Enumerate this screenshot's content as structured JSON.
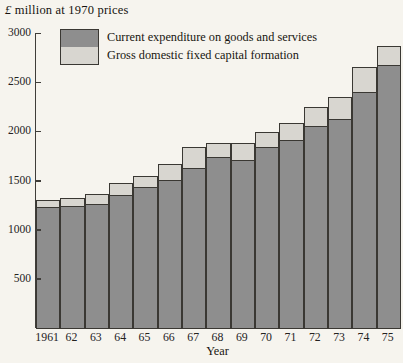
{
  "figure": {
    "title": "£ million at 1970 prices"
  },
  "colors": {
    "background": "#f6f4ee",
    "axis": "#3f3d39",
    "bar_outline": "#3a3833",
    "current_expenditure": "#8e8e8e",
    "capital_formation": "#d8d6d0",
    "text": "#1e1c1a"
  },
  "chart_data": {
    "type": "bar",
    "stacked": true,
    "title": "£ million at 1970 prices",
    "xlabel": "Year",
    "ylabel": "",
    "ylim": [
      0,
      3000
    ],
    "yticks": [
      500,
      1000,
      1500,
      2000,
      2500,
      3000
    ],
    "grid": false,
    "legend_position": "top-left",
    "categories": [
      "1961",
      "62",
      "63",
      "64",
      "65",
      "66",
      "67",
      "68",
      "69",
      "70",
      "71",
      "72",
      "73",
      "74",
      "75"
    ],
    "series": [
      {
        "name": "Current expenditure on goods and services",
        "color": "#8e8e8e",
        "values": [
          1240,
          1250,
          1270,
          1365,
          1445,
          1515,
          1640,
          1750,
          1715,
          1855,
          1920,
          2065,
          2135,
          2410,
          2680
        ]
      },
      {
        "name": "Gross domestic fixed capital formation",
        "color": "#d8d6d0",
        "values": [
          85,
          90,
          115,
          130,
          125,
          175,
          220,
          155,
          185,
          160,
          190,
          200,
          235,
          265,
          210
        ]
      }
    ],
    "totals": [
      1325,
      1340,
      1385,
      1495,
      1570,
      1690,
      1860,
      1905,
      1900,
      2015,
      2110,
      2265,
      2370,
      2675,
      2890
    ]
  }
}
